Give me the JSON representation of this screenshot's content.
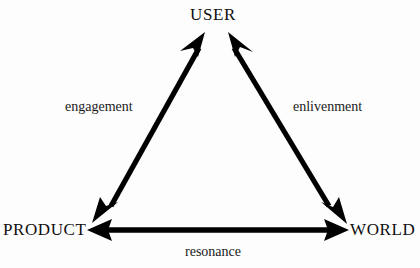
{
  "diagram": {
    "background_color": "#fdfdfd",
    "stroke_color": "#000000",
    "nodes": [
      {
        "id": "user",
        "label": "USER",
        "x": 216,
        "y": 14
      },
      {
        "id": "product",
        "label": "PRODUCT",
        "x": 42,
        "y": 230
      },
      {
        "id": "world",
        "label": "WORLD",
        "x": 381,
        "y": 230
      }
    ],
    "edges": [
      {
        "id": "engagement",
        "label": "engagement",
        "from": "product",
        "to": "user",
        "arrowheads": "both",
        "label_x": 105,
        "label_y": 107
      },
      {
        "id": "enlivenment",
        "label": "enlivenment",
        "from": "user",
        "to": "world",
        "arrowheads": "both",
        "label_x": 333,
        "label_y": 107
      },
      {
        "id": "resonance",
        "label": "resonance",
        "from": "product",
        "to": "world",
        "arrowheads": "both",
        "label_x": 217,
        "label_y": 252
      }
    ]
  }
}
